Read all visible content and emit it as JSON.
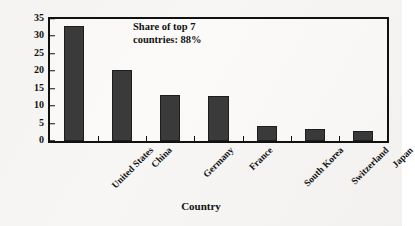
{
  "chart_data": {
    "type": "bar",
    "title": "",
    "xlabel": "Country",
    "ylabel": "Share of total patents (%)",
    "categories": [
      "United States",
      "China",
      "Germany",
      "France",
      "South Korea",
      "Switzerland",
      "Japan"
    ],
    "values": [
      32.9,
      20.4,
      13.2,
      12.9,
      4.2,
      3.4,
      2.9
    ],
    "ylim": [
      0,
      35
    ],
    "yticks": [
      0,
      5,
      10,
      15,
      20,
      25,
      30,
      35
    ],
    "ytick_labels": [
      "0",
      "5",
      "10",
      "15",
      "20",
      "25",
      "30",
      "35"
    ],
    "grid": false,
    "legend": false,
    "bar_color": "#3a3a3a",
    "annotations": [
      {
        "line1": "Share of top 7",
        "line2": "countries: 88%"
      }
    ]
  }
}
